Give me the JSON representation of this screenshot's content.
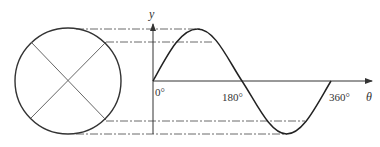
{
  "diagram": {
    "axes": {
      "y_label": "y",
      "x_label": "θ",
      "ticks": [
        {
          "label": "0°",
          "value": 0
        },
        {
          "label": "180°",
          "value": 180
        },
        {
          "label": "360°",
          "value": 360
        }
      ]
    },
    "circle": {
      "center": [
        68,
        81
      ],
      "radius": 53,
      "diagonals": "two crossing diameters forming an X"
    },
    "projection_lines": {
      "style": "dash-dot",
      "levels": [
        "top (peak)",
        "upper chord",
        "lower chord",
        "bottom (trough)"
      ]
    },
    "curve": {
      "type": "sine",
      "period_degrees": 360,
      "start": "0°",
      "zero_crossing": "180°",
      "end": "360°"
    },
    "colors": {
      "stroke": "#333333",
      "dash_line": "#444444",
      "background": "#ffffff"
    }
  }
}
